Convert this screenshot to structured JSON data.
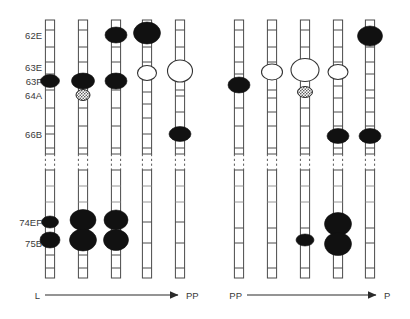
{
  "figure": {
    "width": 410,
    "height": 319,
    "background": "#ffffff",
    "type": "polytene-chromosome-puffing-diagram"
  },
  "locus_labels": [
    {
      "id": "62E",
      "text": "62E",
      "y": 35
    },
    {
      "id": "63E",
      "text": "63E",
      "y": 67
    },
    {
      "id": "63F",
      "text": "63F",
      "y": 81
    },
    {
      "id": "64A",
      "text": "64A",
      "y": 95
    },
    {
      "id": "66B",
      "text": "66B",
      "y": 134
    },
    {
      "id": "74EF",
      "text": "74EF",
      "y": 222
    },
    {
      "id": "75B",
      "text": "75B",
      "y": 243
    }
  ],
  "colors": {
    "filled_puff": "#111111",
    "open_puff_fill": "#ffffff",
    "outline": "#4a4a4a",
    "text": "#3a3a3a",
    "arrow": "#2a2a2a",
    "background": "#ffffff"
  },
  "arrows": [
    {
      "id": "left-arrow",
      "start_label": "L",
      "end_label": "PP",
      "x1": 45,
      "x2": 178,
      "y": 295
    },
    {
      "id": "right-arrow",
      "start_label": "PP",
      "end_label": "P",
      "x1": 247,
      "x2": 376,
      "y": 295
    }
  ],
  "chart_data": {
    "type": "diagram",
    "title": "",
    "xlabel": "",
    "ylabel": "",
    "stage_axes": [
      {
        "group": "left",
        "from": "L",
        "to": "PP"
      },
      {
        "group": "right",
        "from": "PP",
        "to": "P"
      }
    ],
    "loci": [
      "62E",
      "63E",
      "63F",
      "64A",
      "66B",
      "74EF",
      "75B"
    ],
    "chromosomes": [
      {
        "id": "c1",
        "group": "left",
        "index": 0,
        "cx": 50,
        "top": 20,
        "bottom": 278,
        "break_y": 162,
        "bands": [
          30,
          47,
          62,
          74,
          90,
          108,
          126,
          134,
          148,
          186,
          202,
          255,
          268
        ],
        "puffs": [
          {
            "locus": "63F",
            "cy": 81,
            "rx": 9.5,
            "ry": 6.5,
            "style": "filled"
          },
          {
            "locus": "74EF",
            "cy": 222,
            "rx": 8.5,
            "ry": 6.0,
            "style": "filled"
          },
          {
            "locus": "75B",
            "cy": 240,
            "rx": 10.0,
            "ry": 8.0,
            "style": "filled"
          }
        ]
      },
      {
        "id": "c2",
        "group": "left",
        "index": 1,
        "cx": 83,
        "top": 20,
        "bottom": 278,
        "break_y": 162,
        "bands": [
          30,
          47,
          62,
          74,
          108,
          126,
          148,
          186,
          202,
          255,
          268
        ],
        "puffs": [
          {
            "locus": "63F",
            "cy": 81,
            "rx": 11.5,
            "ry": 8.0,
            "style": "filled"
          },
          {
            "locus": "64A",
            "cy": 95,
            "rx": 7.0,
            "ry": 5.5,
            "style": "stipple"
          },
          {
            "locus": "74EF",
            "cy": 220,
            "rx": 13.0,
            "ry": 10.5,
            "style": "filled"
          },
          {
            "locus": "75B",
            "cy": 240,
            "rx": 13.5,
            "ry": 11.0,
            "style": "filled"
          }
        ]
      },
      {
        "id": "c3",
        "group": "left",
        "index": 2,
        "cx": 116,
        "top": 20,
        "bottom": 278,
        "break_y": 162,
        "bands": [
          30,
          47,
          62,
          74,
          90,
          108,
          126,
          148,
          186,
          202,
          255,
          268
        ],
        "puffs": [
          {
            "locus": "62E",
            "cy": 35,
            "rx": 11.0,
            "ry": 8.0,
            "style": "filled"
          },
          {
            "locus": "63F",
            "cy": 81,
            "rx": 11.0,
            "ry": 8.0,
            "style": "filled"
          },
          {
            "locus": "74EF",
            "cy": 220,
            "rx": 12.0,
            "ry": 10.0,
            "style": "filled"
          },
          {
            "locus": "75B",
            "cy": 240,
            "rx": 12.5,
            "ry": 10.5,
            "style": "filled"
          }
        ]
      },
      {
        "id": "c4",
        "group": "left",
        "index": 3,
        "cx": 147,
        "top": 20,
        "bottom": 278,
        "break_y": 162,
        "bands": [
          30,
          47,
          62,
          92,
          104,
          118,
          134,
          148,
          186,
          202,
          222,
          243,
          268
        ],
        "puffs": [
          {
            "locus": "62E",
            "cy": 33,
            "rx": 13.5,
            "ry": 11.0,
            "style": "filled"
          },
          {
            "locus": "63E",
            "cy": 73,
            "rx": 9.5,
            "ry": 7.5,
            "style": "open"
          }
        ]
      },
      {
        "id": "c5",
        "group": "left",
        "index": 4,
        "cx": 180,
        "top": 20,
        "bottom": 278,
        "break_y": 162,
        "bands": [
          30,
          47,
          90,
          96,
          112,
          148,
          186,
          202,
          222,
          243,
          268
        ],
        "puffs": [
          {
            "locus": "63E",
            "cy": 71,
            "rx": 12.5,
            "ry": 11.0,
            "style": "open"
          },
          {
            "locus": "66B",
            "cy": 134,
            "rx": 11.0,
            "ry": 7.5,
            "style": "filled"
          }
        ]
      },
      {
        "id": "c6",
        "group": "right",
        "index": 0,
        "cx": 239,
        "top": 20,
        "bottom": 278,
        "break_y": 162,
        "bands": [
          30,
          47,
          62,
          74,
          90,
          108,
          126,
          148,
          186,
          202,
          228,
          243,
          268
        ],
        "puffs": [
          {
            "locus": "63F",
            "cy": 85,
            "rx": 11.0,
            "ry": 8.0,
            "style": "filled"
          }
        ]
      },
      {
        "id": "c7",
        "group": "right",
        "index": 1,
        "cx": 272,
        "top": 20,
        "bottom": 278,
        "break_y": 162,
        "bands": [
          30,
          47,
          62,
          90,
          98,
          112,
          126,
          148,
          186,
          202,
          228,
          243,
          268
        ],
        "puffs": [
          {
            "locus": "63E",
            "cy": 72,
            "rx": 10.5,
            "ry": 8.0,
            "style": "open"
          }
        ]
      },
      {
        "id": "c8",
        "group": "right",
        "index": 2,
        "cx": 305,
        "top": 20,
        "bottom": 278,
        "break_y": 162,
        "bands": [
          30,
          47,
          62,
          108,
          126,
          148,
          186,
          202,
          228,
          268
        ],
        "puffs": [
          {
            "locus": "63E",
            "cy": 70,
            "rx": 14.0,
            "ry": 11.5,
            "style": "open"
          },
          {
            "locus": "64A",
            "cy": 92,
            "rx": 7.5,
            "ry": 5.5,
            "style": "stipple"
          },
          {
            "locus": "74EF",
            "cy": 240,
            "rx": 9.0,
            "ry": 6.0,
            "style": "filled"
          }
        ]
      },
      {
        "id": "c9",
        "group": "right",
        "index": 3,
        "cx": 338,
        "top": 20,
        "bottom": 278,
        "break_y": 162,
        "bands": [
          30,
          47,
          62,
          86,
          98,
          112,
          126,
          148,
          186,
          202,
          268
        ],
        "puffs": [
          {
            "locus": "63E",
            "cy": 72,
            "rx": 10.0,
            "ry": 7.5,
            "style": "open"
          },
          {
            "locus": "66B",
            "cy": 136,
            "rx": 11.0,
            "ry": 7.5,
            "style": "filled"
          },
          {
            "locus": "74EF",
            "cy": 224,
            "rx": 13.5,
            "ry": 11.5,
            "style": "filled"
          },
          {
            "locus": "75B",
            "cy": 244,
            "rx": 13.5,
            "ry": 11.5,
            "style": "filled"
          }
        ]
      },
      {
        "id": "c10",
        "group": "right",
        "index": 4,
        "cx": 370,
        "top": 20,
        "bottom": 278,
        "break_y": 162,
        "bands": [
          47,
          62,
          74,
          90,
          98,
          112,
          126,
          148,
          186,
          202,
          228,
          243,
          268
        ],
        "puffs": [
          {
            "locus": "62E",
            "cy": 36,
            "rx": 12.5,
            "ry": 10.0,
            "style": "filled"
          },
          {
            "locus": "66B",
            "cy": 136,
            "rx": 11.0,
            "ry": 7.5,
            "style": "filled"
          }
        ]
      }
    ]
  }
}
